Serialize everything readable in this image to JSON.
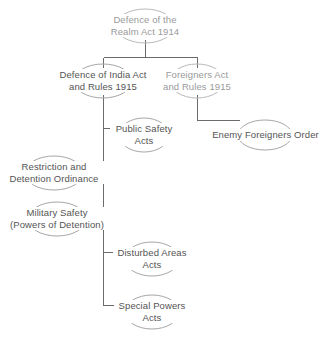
{
  "diagram": {
    "type": "hierarchy-tree",
    "line_color": "#6b6b6b",
    "node_outline_color": "#b0b0b0",
    "text_color_primary": "#545454",
    "text_color_muted": "#9a9a9a",
    "background": "#ffffff",
    "nodes": [
      {
        "id": "root",
        "lines": [
          "Defence of the",
          "Realm Act 1914"
        ],
        "tone": "light",
        "cx": 145,
        "cy": 26
      },
      {
        "id": "defence-india",
        "lines": [
          "Defence of India Act",
          "and Rules 1915"
        ],
        "tone": "dark",
        "cx": 103,
        "cy": 81
      },
      {
        "id": "foreigners-act",
        "lines": [
          "Foreigners Act",
          "and Rules 1915"
        ],
        "tone": "light",
        "cx": 197,
        "cy": 81
      },
      {
        "id": "public-safety",
        "lines": [
          "Public Safety",
          "Acts"
        ],
        "tone": "dark",
        "cx": 144,
        "cy": 135
      },
      {
        "id": "enemy-foreigners",
        "lines": [
          "Enemy Foreigners Order"
        ],
        "tone": "dark",
        "cx": 265,
        "cy": 135
      },
      {
        "id": "restriction-detention",
        "lines": [
          "Restriction and",
          "Detention Ordinance"
        ],
        "tone": "dark",
        "cx": 54,
        "cy": 173
      },
      {
        "id": "military-safety",
        "lines": [
          "Military Safety",
          "(Powers of Detention)"
        ],
        "tone": "dark",
        "cx": 57,
        "cy": 219
      },
      {
        "id": "disturbed-areas",
        "lines": [
          "Disturbed Areas",
          "Acts"
        ],
        "tone": "dark",
        "cx": 152,
        "cy": 259
      },
      {
        "id": "special-powers",
        "lines": [
          "Special Powers",
          "Acts"
        ],
        "tone": "dark",
        "cx": 152,
        "cy": 312
      }
    ],
    "edges": [
      {
        "from": "root",
        "to": "defence-india"
      },
      {
        "from": "root",
        "to": "foreigners-act"
      },
      {
        "from": "defence-india",
        "to": "public-safety"
      },
      {
        "from": "defence-india",
        "to": "restriction-detention"
      },
      {
        "from": "defence-india",
        "to": "military-safety"
      },
      {
        "from": "defence-india",
        "to": "disturbed-areas"
      },
      {
        "from": "defence-india",
        "to": "special-powers"
      },
      {
        "from": "foreigners-act",
        "to": "enemy-foreigners"
      }
    ]
  }
}
